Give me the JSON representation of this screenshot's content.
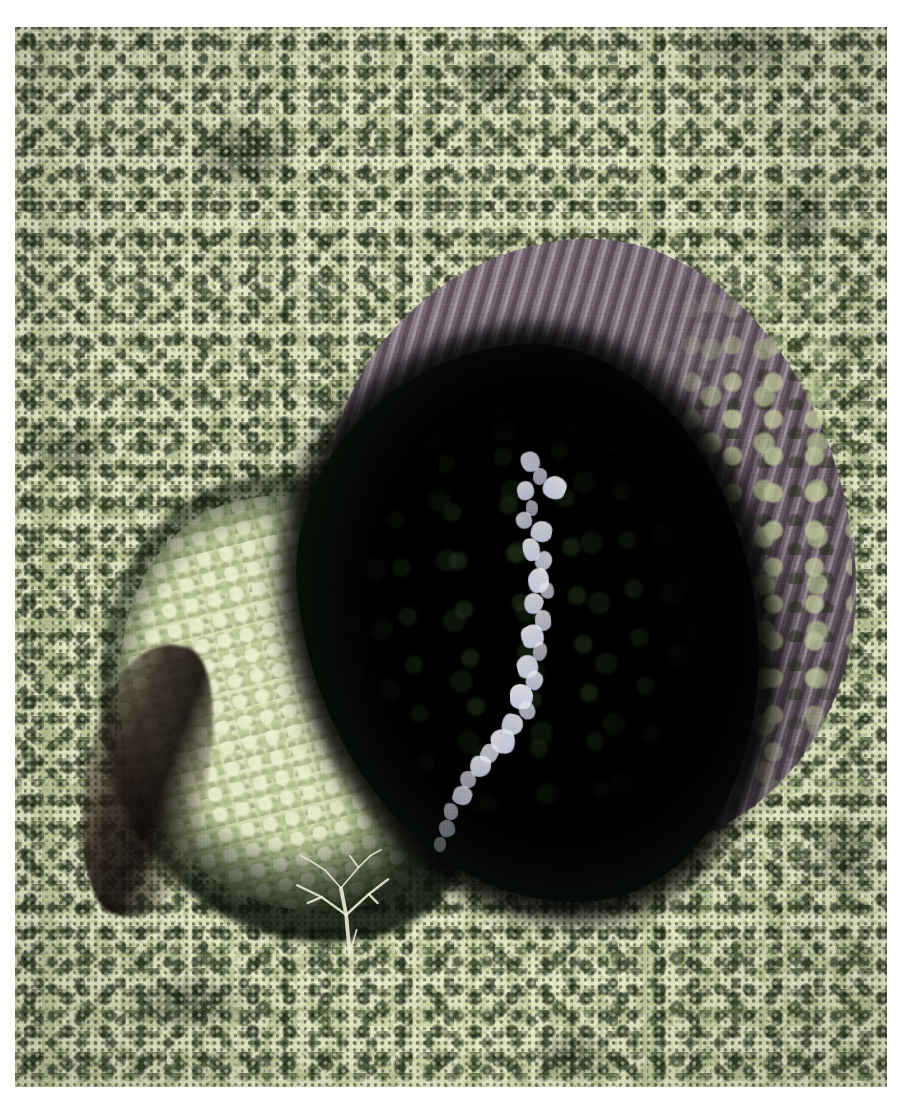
{
  "image": {
    "kind": "aerial-photograph",
    "subject": "Forested sinkhole / volcanic pit crater with waterfall",
    "orientation": "portrait",
    "width_px": 900,
    "height_px": 1104,
    "border": {
      "color": "#ffffff",
      "left_px": 15,
      "top_px": 27,
      "right_px": 13,
      "bottom_px": 17
    }
  },
  "palette": {
    "paper_white": "#ffffff",
    "canopy_light": "#dde2bb",
    "canopy_mid": "#b9c295",
    "canopy_shadow": "#1e2612",
    "rim_rock_light": "#cec4ce",
    "rim_rock_mid": "#7d6b7b",
    "rim_rock_dark": "#40343f",
    "void_black": "#05080a",
    "crater_floor_green": "#cfd7ab",
    "waterfall_white": "#ecececfa",
    "waterfall_lavender": "#ced0ec"
  },
  "regions": [
    {
      "id": "forest-canopy",
      "label": "Dense rainforest canopy",
      "description": "Pale sage-green treetops with dark inter-crown shadows filling the whole frame around the pit",
      "color": "#b9c295"
    },
    {
      "id": "crater-rim-rock",
      "label": "Crater rim rock face",
      "description": "Purple-grey striated bare rock band arcing across the upper and right edge of the pit",
      "color": "#7d6b7b"
    },
    {
      "id": "sinkhole-void",
      "label": "Sinkhole shadow void",
      "description": "Large near-black oval opening occupying the centre-right of the frame",
      "color": "#05080a"
    },
    {
      "id": "crater-floor",
      "label": "Vegetated crater floor",
      "description": "Bright pale-green shelf of low vegetation on the lower-left inside the pit",
      "color": "#cfd7ab"
    },
    {
      "id": "waterfall",
      "label": "Waterfall and stream",
      "description": "White-lavender cascade running top-to-bottom through the shadowed interior",
      "color": "#ecececfa"
    },
    {
      "id": "bare-tree",
      "label": "Bare skeletal tree",
      "description": "Leafless pale-branched tree silhouetted against the dark floor near the bottom of the pit",
      "color": "#e8ebd2"
    },
    {
      "id": "left-gully",
      "label": "Shadowed gully",
      "description": "Dark crescent groove cutting down the inner left wall of the crater",
      "color": "#241814"
    }
  ],
  "waterfall_path": [
    {
      "x": 58.0,
      "y": 40.0,
      "w": 2.2,
      "h": 2.0,
      "o": 0.8
    },
    {
      "x": 59.4,
      "y": 41.6,
      "w": 1.6,
      "h": 1.6,
      "o": 0.7
    },
    {
      "x": 57.6,
      "y": 42.8,
      "w": 2.0,
      "h": 1.8,
      "o": 0.85
    },
    {
      "x": 60.6,
      "y": 42.4,
      "w": 2.6,
      "h": 2.2,
      "o": 0.92
    },
    {
      "x": 58.6,
      "y": 44.6,
      "w": 1.4,
      "h": 1.5,
      "o": 0.65
    },
    {
      "x": 57.4,
      "y": 45.8,
      "w": 1.8,
      "h": 1.6,
      "o": 0.78
    },
    {
      "x": 59.2,
      "y": 46.6,
      "w": 2.4,
      "h": 2.0,
      "o": 0.88
    },
    {
      "x": 58.2,
      "y": 48.2,
      "w": 2.0,
      "h": 2.2,
      "o": 0.9
    },
    {
      "x": 59.8,
      "y": 49.4,
      "w": 1.8,
      "h": 1.8,
      "o": 0.82
    },
    {
      "x": 58.8,
      "y": 51.0,
      "w": 2.4,
      "h": 2.4,
      "o": 0.93
    },
    {
      "x": 60.2,
      "y": 52.4,
      "w": 1.6,
      "h": 1.6,
      "o": 0.72
    },
    {
      "x": 58.4,
      "y": 53.4,
      "w": 2.2,
      "h": 2.0,
      "o": 0.88
    },
    {
      "x": 59.6,
      "y": 55.0,
      "w": 1.8,
      "h": 2.0,
      "o": 0.8
    },
    {
      "x": 58.0,
      "y": 56.4,
      "w": 2.6,
      "h": 2.2,
      "o": 0.92
    },
    {
      "x": 59.4,
      "y": 58.0,
      "w": 1.6,
      "h": 1.8,
      "o": 0.7
    },
    {
      "x": 57.6,
      "y": 59.2,
      "w": 2.4,
      "h": 2.2,
      "o": 0.9
    },
    {
      "x": 58.6,
      "y": 60.8,
      "w": 2.0,
      "h": 1.8,
      "o": 0.84
    },
    {
      "x": 56.8,
      "y": 62.0,
      "w": 2.6,
      "h": 2.4,
      "o": 0.94
    },
    {
      "x": 57.8,
      "y": 63.6,
      "w": 1.8,
      "h": 1.8,
      "o": 0.76
    },
    {
      "x": 55.8,
      "y": 64.8,
      "w": 2.4,
      "h": 2.0,
      "o": 0.88
    },
    {
      "x": 54.6,
      "y": 66.2,
      "w": 2.8,
      "h": 2.4,
      "o": 0.92
    },
    {
      "x": 53.4,
      "y": 67.6,
      "w": 2.0,
      "h": 1.8,
      "o": 0.8
    },
    {
      "x": 52.2,
      "y": 68.8,
      "w": 2.4,
      "h": 2.0,
      "o": 0.86
    },
    {
      "x": 51.0,
      "y": 70.2,
      "w": 1.8,
      "h": 1.6,
      "o": 0.68
    },
    {
      "x": 50.2,
      "y": 71.6,
      "w": 2.2,
      "h": 1.8,
      "o": 0.74
    },
    {
      "x": 49.2,
      "y": 73.2,
      "w": 1.6,
      "h": 1.6,
      "o": 0.55
    },
    {
      "x": 48.6,
      "y": 74.8,
      "w": 1.8,
      "h": 1.6,
      "o": 0.45
    },
    {
      "x": 48.0,
      "y": 76.4,
      "w": 1.4,
      "h": 1.4,
      "o": 0.35
    }
  ],
  "bare_tree": {
    "trunk_color": "#e6ead0",
    "branch_count": 11,
    "branches": [
      "M 52 96 L 50 70 L 47 52",
      "M 50 70 L 36 58 L 22 50",
      "M 36 58 L 28 62",
      "M 50 70 L 63 56 L 74 46",
      "M 63 56 L 68 62",
      "M 47 52 L 38 40 L 30 34",
      "M 47 52 L 57 38 L 64 30",
      "M 57 38 L 52 30",
      "M 30 34 L 24 30",
      "M 64 30 L 70 26",
      "M 52 96 L 56 80"
    ]
  }
}
